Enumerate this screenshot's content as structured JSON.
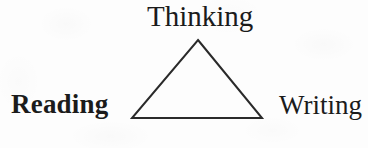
{
  "diagram": {
    "type": "triangle-relationship-diagram",
    "background_color": "#fdfdfd",
    "stroke_color": "#2a2a2a",
    "text_color": "#1b1b1b",
    "nodes": [
      {
        "id": "thinking",
        "label": "Thinking",
        "position": "apex",
        "emphasis": "normal"
      },
      {
        "id": "reading",
        "label": "Reading",
        "position": "bottom-left",
        "emphasis": "bold"
      },
      {
        "id": "writing",
        "label": "Writing",
        "position": "bottom-right",
        "emphasis": "normal"
      }
    ],
    "shape": {
      "name": "triangle",
      "apex": {
        "x": 198,
        "y": 40
      },
      "bottom_left": {
        "x": 132,
        "y": 118
      },
      "bottom_right": {
        "x": 262,
        "y": 118
      },
      "stroke_width": 2
    }
  }
}
